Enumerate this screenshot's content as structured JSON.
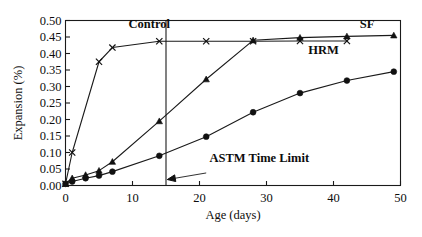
{
  "chart_data": {
    "type": "line",
    "title": "",
    "xlabel": "Age (days)",
    "ylabel": "Expansion (%)",
    "xlim": [
      0,
      50
    ],
    "ylim": [
      0.0,
      0.5
    ],
    "xticks": [
      "0",
      "10",
      "20",
      "30",
      "40",
      "50"
    ],
    "xtick_values": [
      0,
      10,
      20,
      30,
      40,
      50
    ],
    "yticks": [
      "0.00",
      "0.05",
      "0.10",
      "0.15",
      "0.20",
      "0.25",
      "0.30",
      "0.35",
      "0.40",
      "0.45",
      "0.50"
    ],
    "ytick_values": [
      0.0,
      0.05,
      0.1,
      0.15,
      0.2,
      0.25,
      0.3,
      0.35,
      0.4,
      0.45,
      0.5
    ],
    "grid": false,
    "legend_position": "inline-labels",
    "series": [
      {
        "name": "Control",
        "marker": "x",
        "label_x": 12.5,
        "label_y": 0.478,
        "x": [
          0,
          1,
          5,
          7,
          14,
          21,
          28,
          35,
          42
        ],
        "y": [
          0.005,
          0.1,
          0.375,
          0.418,
          0.437,
          0.437,
          0.437,
          0.438,
          0.438
        ]
      },
      {
        "name": "SF",
        "marker": "triangle",
        "label_x": 45.0,
        "label_y": 0.478,
        "x": [
          0,
          1,
          3,
          5,
          7,
          14,
          21,
          28,
          35,
          42,
          49
        ],
        "y": [
          0.005,
          0.022,
          0.032,
          0.045,
          0.072,
          0.195,
          0.322,
          0.44,
          0.448,
          0.452,
          0.455
        ]
      },
      {
        "name": "HRM",
        "marker": "circle",
        "label_x": 38.5,
        "label_y": 0.4,
        "x": [
          0,
          1,
          3,
          5,
          7,
          14,
          21,
          28,
          35,
          42,
          49
        ],
        "y": [
          0.005,
          0.012,
          0.022,
          0.03,
          0.042,
          0.09,
          0.148,
          0.222,
          0.28,
          0.318,
          0.345
        ]
      }
    ],
    "annotations": [
      {
        "text": "ASTM Time Limit",
        "vline_x": 15,
        "text_x": 21.5,
        "text_y": 0.072,
        "arrow_from_x": 21.0,
        "arrow_from_y": 0.038,
        "arrow_to_x": 15.2,
        "arrow_to_y": 0.018
      }
    ]
  },
  "colors": {
    "ink": "#111111",
    "axis": "#1a1a1a",
    "background": "#ffffff"
  }
}
